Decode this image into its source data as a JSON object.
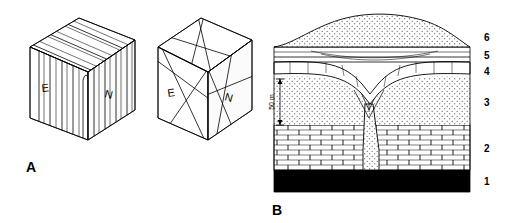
{
  "figure": {
    "type": "geological-illustration",
    "panels": [
      {
        "letter": "A",
        "name": "block-diagrams",
        "blocks": [
          {
            "name": "block-left",
            "description": "3D block diagram with steeply dipping / vertical folded layers",
            "face_labels": {
              "left": "E",
              "right": "N"
            }
          },
          {
            "name": "block-right",
            "description": "3D block diagram with intersecting planar fault surfaces",
            "face_labels": {
              "left": "E",
              "right": "N"
            }
          }
        ]
      },
      {
        "letter": "B",
        "name": "cross-section",
        "scale_bar": {
          "label": "50 m"
        },
        "units": [
          {
            "number": "1",
            "name": "basal-black-unit",
            "pattern": "solid-black"
          },
          {
            "number": "2",
            "name": "brick-unit",
            "pattern": "brick"
          },
          {
            "number": "3",
            "name": "stippled-unit",
            "pattern": "stipple"
          },
          {
            "number": "4",
            "name": "blocky-unit",
            "pattern": "blocky"
          },
          {
            "number": "5",
            "name": "laminated-unit",
            "pattern": "thin-lines"
          },
          {
            "number": "6",
            "name": "dome-unit",
            "pattern": "stipple-dome"
          }
        ]
      }
    ]
  }
}
